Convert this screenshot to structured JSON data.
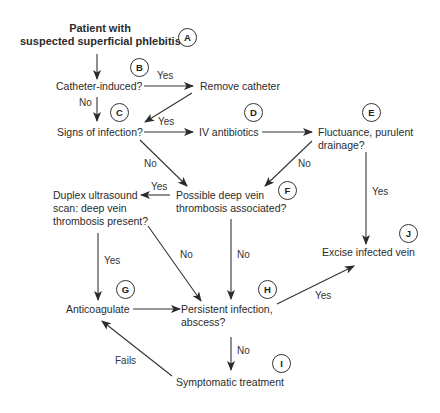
{
  "diagram": {
    "type": "flowchart",
    "nodes": {
      "start": {
        "label_line1": "Patient with",
        "label_line2": "suspected superficial phlebitis",
        "badge": "A"
      },
      "catheter": {
        "label": "Catheter-induced?",
        "badge": "B"
      },
      "remove_catheter": {
        "label": "Remove catheter"
      },
      "infection": {
        "label": "Signs of infection?",
        "badge": "C"
      },
      "iv_antibiotics": {
        "label": "IV antibiotics",
        "badge": "D"
      },
      "fluctuance": {
        "label_line1": "Fluctuance, purulent",
        "label_line2": "drainage?",
        "badge": "E"
      },
      "possible_dvt": {
        "label_line1": "Possible deep vein",
        "label_line2": "thrombosis associated?",
        "badge": "F"
      },
      "duplex": {
        "label_line1": "Duplex ultrasound",
        "label_line2": "scan: deep vein",
        "label_line3": "thrombosis present?"
      },
      "excise": {
        "label": "Excise infected vein",
        "badge": "J"
      },
      "anticoagulate": {
        "label": "Anticoagulate",
        "badge": "G"
      },
      "persistent": {
        "label_line1": "Persistent infection,",
        "label_line2": "abscess?",
        "badge": "H"
      },
      "symptomatic": {
        "label": "Symptomatic treatment",
        "badge": "I"
      }
    },
    "edge_labels": {
      "catheter_yes": "Yes",
      "catheter_no": "No",
      "infection_yes": "Yes",
      "infection_no": "No",
      "fluctuance_no": "No",
      "fluctuance_yes": "Yes",
      "possible_dvt_yes": "Yes",
      "possible_dvt_no": "No",
      "duplex_yes": "Yes",
      "duplex_no": "No",
      "persistent_yes": "Yes",
      "persistent_no": "No",
      "symptomatic_fails": "Fails"
    },
    "edges": [
      {
        "from": "start",
        "to": "catheter",
        "label": ""
      },
      {
        "from": "catheter",
        "to": "remove_catheter",
        "label": "Yes"
      },
      {
        "from": "catheter",
        "to": "infection",
        "label": "No"
      },
      {
        "from": "remove_catheter",
        "to": "infection",
        "label": ""
      },
      {
        "from": "infection",
        "to": "iv_antibiotics",
        "label": "Yes"
      },
      {
        "from": "infection",
        "to": "possible_dvt",
        "label": "No"
      },
      {
        "from": "iv_antibiotics",
        "to": "fluctuance",
        "label": ""
      },
      {
        "from": "fluctuance",
        "to": "possible_dvt",
        "label": "No"
      },
      {
        "from": "fluctuance",
        "to": "excise",
        "label": "Yes"
      },
      {
        "from": "possible_dvt",
        "to": "duplex",
        "label": "Yes"
      },
      {
        "from": "possible_dvt",
        "to": "persistent",
        "label": "No"
      },
      {
        "from": "duplex",
        "to": "anticoagulate",
        "label": "Yes"
      },
      {
        "from": "duplex",
        "to": "persistent",
        "label": "No"
      },
      {
        "from": "anticoagulate",
        "to": "persistent",
        "label": ""
      },
      {
        "from": "persistent",
        "to": "excise",
        "label": "Yes"
      },
      {
        "from": "persistent",
        "to": "symptomatic",
        "label": "No"
      },
      {
        "from": "symptomatic",
        "to": "anticoagulate",
        "label": "Fails"
      }
    ]
  }
}
